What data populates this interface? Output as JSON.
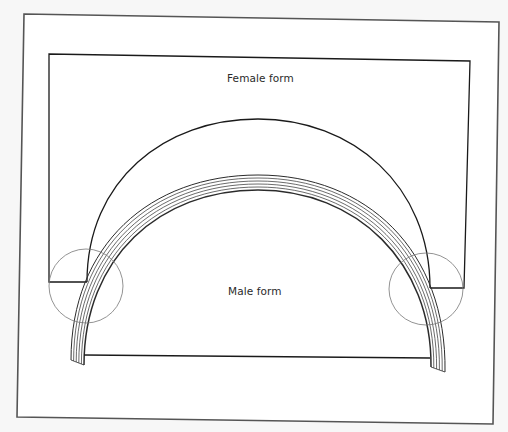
{
  "diagram": {
    "title": "",
    "labels": {
      "female_form": "Female form",
      "male_form": "Male form"
    },
    "colors": {
      "background": "#f7f7f7",
      "paper": "#ffffff",
      "frame_stroke": "#555555",
      "form_stroke": "#1a1a1a",
      "laminate_stroke": "#2b2b2b",
      "circle_stroke": "#777777",
      "text": "#2a2a2a"
    },
    "elements": [
      {
        "id": "outer-frame",
        "type": "rectangle",
        "description": "outer border frame"
      },
      {
        "id": "female-form",
        "type": "shape",
        "label": "Female form",
        "description": "rectangular block with semicircular cavity"
      },
      {
        "id": "laminated-strips",
        "type": "arc-bundle",
        "count": 6,
        "description": "bent laminations between forms"
      },
      {
        "id": "male-form",
        "type": "shape",
        "label": "Male form",
        "description": "semicircular block inside the arch"
      },
      {
        "id": "detail-circle-left",
        "type": "circle",
        "description": "highlight circle at left junction"
      },
      {
        "id": "detail-circle-right",
        "type": "circle",
        "description": "highlight circle at right junction"
      }
    ]
  }
}
